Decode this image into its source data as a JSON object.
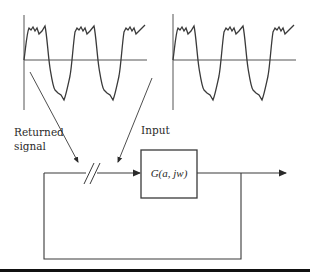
{
  "diagram": {
    "type": "describing-function feedback loop",
    "labels": {
      "returned_line1": "Returned",
      "returned_line2": "signal",
      "input": "Input",
      "block": "G(a, jw)"
    },
    "waveforms": [
      {
        "name": "returned-signal-waveform",
        "cycles": 2.5,
        "shape": "clipped-sine-with-ripple"
      },
      {
        "name": "input-waveform",
        "cycles": 2.5,
        "shape": "clipped-sine-with-ripple"
      }
    ],
    "colors": {
      "stroke": "#3a3a3a",
      "text": "#2a2a2a",
      "background": "#ffffff",
      "rule": "#111111"
    }
  }
}
